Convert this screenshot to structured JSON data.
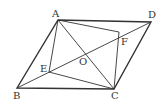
{
  "diagram": {
    "type": "geometry",
    "colors": {
      "stroke": "#333333",
      "background": "#ffffff"
    },
    "points": {
      "A": {
        "label": "A",
        "x": 58,
        "y": 20
      },
      "B": {
        "label": "B",
        "x": 17,
        "y": 88
      },
      "C": {
        "label": "C",
        "x": 114,
        "y": 89
      },
      "D": {
        "label": "D",
        "x": 151,
        "y": 22
      },
      "E": {
        "label": "E",
        "x": 49,
        "y": 72
      },
      "F": {
        "label": "F",
        "x": 119,
        "y": 32
      },
      "O": {
        "label": "O",
        "x": 85,
        "y": 55
      }
    },
    "segments": [
      "AB",
      "BC",
      "CD",
      "DA",
      "AC",
      "BD",
      "AE",
      "EC",
      "AF",
      "FC"
    ]
  }
}
